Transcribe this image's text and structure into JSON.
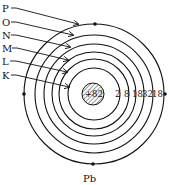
{
  "diagram": {
    "element_symbol": "Pb",
    "nucleus_charge": "+82",
    "shells": [
      {
        "name": "K",
        "electrons": "2"
      },
      {
        "name": "L",
        "electrons": "8"
      },
      {
        "name": "M",
        "electrons": "18"
      },
      {
        "name": "N",
        "electrons": "32"
      },
      {
        "name": "O",
        "electrons": "18"
      },
      {
        "name": "P",
        "electrons": "4"
      }
    ],
    "colors": {
      "ink": "#111111",
      "background": "#ffffff"
    }
  }
}
